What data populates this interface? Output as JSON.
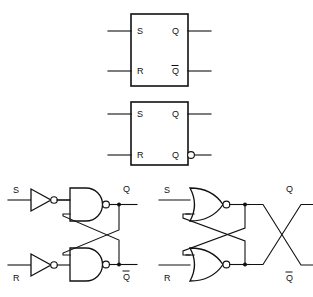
{
  "figure": {
    "background_color": "#ffffff",
    "line_color": "#111111",
    "width": 313,
    "height": 297
  },
  "block_symbol_1": {
    "name": "sr-latch-block-symbol-plain",
    "inputs": [
      {
        "label": "S",
        "position": "top-left"
      },
      {
        "label": "R",
        "position": "bottom-left"
      }
    ],
    "outputs": [
      {
        "label": "Q",
        "position": "top-right",
        "inverted": false
      },
      {
        "label": "Q",
        "position": "bottom-right",
        "inverted": true,
        "overbar": true
      }
    ]
  },
  "block_symbol_2": {
    "name": "sr-latch-block-symbol-bubble",
    "inputs": [
      {
        "label": "S",
        "position": "top-left"
      },
      {
        "label": "R",
        "position": "bottom-left"
      }
    ],
    "outputs": [
      {
        "label": "Q",
        "position": "top-right",
        "inverted": false
      },
      {
        "label": "Q",
        "position": "bottom-right",
        "inverted": true,
        "bubble": true
      }
    ]
  },
  "nand_circuit": {
    "name": "nand-sr-latch",
    "gate_type": "NAND",
    "has_input_inverters": true,
    "inputs": [
      {
        "label": "S",
        "through": "inverter"
      },
      {
        "label": "R",
        "through": "inverter"
      }
    ],
    "outputs": [
      {
        "label": "Q",
        "overbar": false
      },
      {
        "label": "Q",
        "overbar": true
      }
    ],
    "cross_coupled": true,
    "outputs_crossed": false
  },
  "nor_circuit": {
    "name": "nor-sr-latch",
    "gate_type": "NOR",
    "has_input_inverters": false,
    "inputs": [
      {
        "label": "S"
      },
      {
        "label": "R"
      }
    ],
    "outputs": [
      {
        "label": "Q",
        "overbar": false
      },
      {
        "label": "Q",
        "overbar": true
      }
    ],
    "cross_coupled": true,
    "outputs_crossed": true
  }
}
